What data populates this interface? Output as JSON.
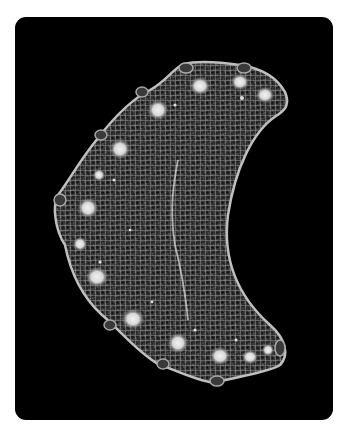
{
  "image": {
    "subject": "crescent-shaped microfossil with reticulate mesh texture and marginal pores",
    "background_color": "#000000",
    "page_background": "#ffffff",
    "frame": {
      "x": 15,
      "y": 17,
      "width": 318,
      "height": 403,
      "corner_radius": 11
    }
  }
}
